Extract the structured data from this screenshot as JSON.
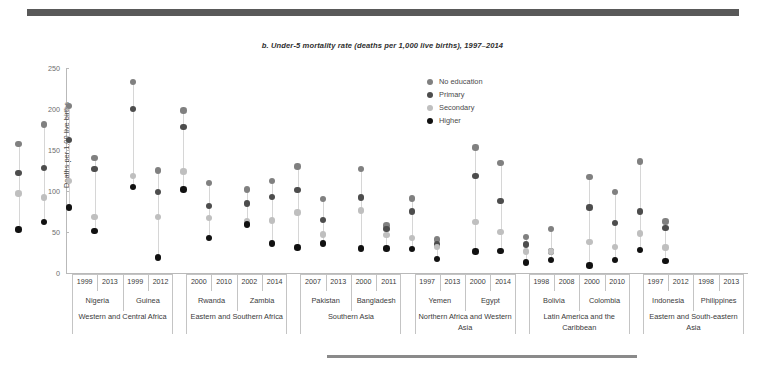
{
  "figure": {
    "title": "b. Under-5 mortality rate (deaths per 1,000 live births), 1997–2014",
    "top_rule_color": "#595959",
    "bottom_rule_color": "#8a8a8a"
  },
  "legend": {
    "position": "top-right-inside",
    "items": [
      {
        "label": "No education",
        "color": "#808080"
      },
      {
        "label": "Primary",
        "color": "#4d4d4d"
      },
      {
        "label": "Secondary",
        "color": "#bfbfbf"
      },
      {
        "label": "Higher",
        "color": "#111111"
      }
    ]
  },
  "axes": {
    "ylabel": "Deaths per 1,00 live births",
    "yticks": [
      0,
      50,
      100,
      150,
      200,
      250
    ],
    "ylim": [
      0,
      250
    ],
    "grid": false
  },
  "chart_data": {
    "type": "scatter",
    "title": "b. Under-5 mortality rate (deaths per 1,000 live births), 1997–2014",
    "xlabel": "",
    "ylabel": "Deaths per 1,00 live births",
    "ylim": [
      0,
      250
    ],
    "yticks": [
      0,
      50,
      100,
      150,
      200,
      250
    ],
    "series_names": [
      "No education",
      "Primary",
      "Secondary",
      "Higher"
    ],
    "regions": [
      {
        "region": "Western and Central Africa",
        "countries": [
          {
            "country": "Nigeria",
            "years": [
              {
                "year": "1999",
                "no_education": 157,
                "primary": 122,
                "secondary": 97,
                "higher": 53
              },
              {
                "year": "2013",
                "no_education": 181,
                "primary": 128,
                "secondary": 92,
                "higher": 62
              }
            ]
          },
          {
            "country": "Guinea",
            "years": [
              {
                "year": "1999",
                "no_education": 204,
                "primary": 162,
                "secondary": 112,
                "higher": 80
              },
              {
                "year": "2012",
                "no_education": 140,
                "primary": 127,
                "secondary": 68,
                "higher": 51
              }
            ]
          }
        ]
      },
      {
        "region": "Eastern and Southern Africa",
        "countries": [
          {
            "country": "Rwanda",
            "years": [
              {
                "year": "2000",
                "no_education": 233,
                "primary": 200,
                "secondary": 118,
                "higher": 105
              },
              {
                "year": "2010",
                "no_education": 125,
                "primary": 99,
                "secondary": 68,
                "higher": 19
              }
            ]
          },
          {
            "country": "Zambia",
            "years": [
              {
                "year": "2002",
                "no_education": 198,
                "primary": 178,
                "secondary": 124,
                "higher": 102
              },
              {
                "year": "2014",
                "no_education": 110,
                "primary": 82,
                "secondary": 67,
                "higher": 43
              }
            ]
          }
        ]
      },
      {
        "region": "Southern Asia",
        "countries": [
          {
            "country": "Pakistan",
            "years": [
              {
                "year": "2007",
                "no_education": 102,
                "primary": 85,
                "secondary": 63,
                "higher": 59
              },
              {
                "year": "2013",
                "no_education": 112,
                "primary": 93,
                "secondary": 64,
                "higher": 36
              }
            ]
          },
          {
            "country": "Bangladesh",
            "years": [
              {
                "year": "2000",
                "no_education": 130,
                "primary": 101,
                "secondary": 74,
                "higher": 31
              },
              {
                "year": "2011",
                "no_education": 90,
                "primary": 65,
                "secondary": 47,
                "higher": 36
              }
            ]
          }
        ]
      },
      {
        "region": "Northern Africa and Western Asia",
        "countries": [
          {
            "country": "Yemen",
            "years": [
              {
                "year": "1997",
                "no_education": 127,
                "primary": 92,
                "secondary": 76,
                "higher": 30
              },
              {
                "year": "2013",
                "no_education": 58,
                "primary": 54,
                "secondary": 46,
                "higher": 30
              }
            ]
          },
          {
            "country": "Egypt",
            "years": [
              {
                "year": "2000",
                "no_education": 91,
                "primary": 75,
                "secondary": 43,
                "higher": 29
              },
              {
                "year": "2014",
                "no_education": 41,
                "primary": 35,
                "secondary": 32,
                "higher": 17
              }
            ]
          }
        ]
      },
      {
        "region": "Latin America and the Caribbean",
        "countries": [
          {
            "country": "Bolivia",
            "years": [
              {
                "year": "1998",
                "no_education": 153,
                "primary": 118,
                "secondary": 62,
                "higher": 26
              },
              {
                "year": "2008",
                "no_education": 134,
                "primary": 88,
                "secondary": 50,
                "higher": 27
              }
            ]
          },
          {
            "country": "Colombia",
            "years": [
              {
                "year": "2000",
                "no_education": 44,
                "primary": 35,
                "secondary": 26,
                "higher": 13
              },
              {
                "year": "2010",
                "no_education": 54,
                "primary": 26,
                "secondary": 26,
                "higher": 16
              }
            ]
          }
        ]
      },
      {
        "region": "Eastern and South-eastern Asia",
        "countries": [
          {
            "country": "Indonesia",
            "years": [
              {
                "year": "1997",
                "no_education": 117,
                "primary": 80,
                "secondary": 38,
                "higher": 9
              },
              {
                "year": "2012",
                "no_education": 99,
                "primary": 61,
                "secondary": 32,
                "higher": 16
              }
            ]
          },
          {
            "country": "Philippines",
            "years": [
              {
                "year": "1998",
                "no_education": 136,
                "primary": 75,
                "secondary": 48,
                "higher": 28
              },
              {
                "year": "2013",
                "no_education": 63,
                "primary": 55,
                "secondary": 31,
                "higher": 15
              }
            ]
          }
        ]
      }
    ]
  }
}
